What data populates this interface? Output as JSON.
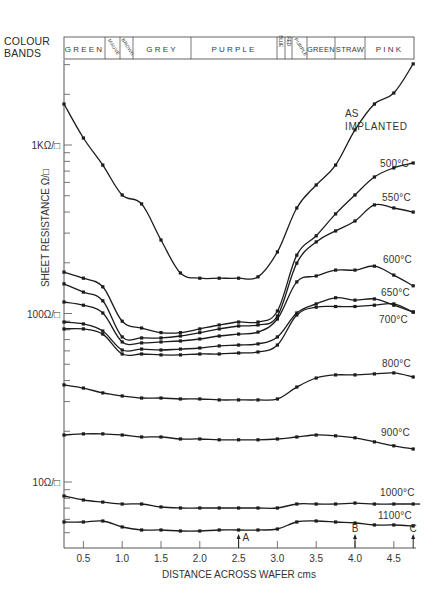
{
  "header": {
    "colour_bands_label_line1": "COLOUR",
    "colour_bands_label_line2": "BANDS"
  },
  "colour_bands": [
    {
      "label": "GREEN",
      "from_px": 64,
      "to_px": 105,
      "style": "h"
    },
    {
      "label": "MAUVE",
      "from_px": 105,
      "to_px": 120,
      "style": "diag"
    },
    {
      "label": "BROWN",
      "from_px": 120,
      "to_px": 133,
      "style": "diag"
    },
    {
      "label": "GREY",
      "from_px": 133,
      "to_px": 191,
      "style": "h"
    },
    {
      "label": "PURPLE",
      "from_px": 191,
      "to_px": 277,
      "style": "h"
    },
    {
      "label": "BLUE",
      "from_px": 277,
      "to_px": 285,
      "style": "v"
    },
    {
      "label": "RED",
      "from_px": 285,
      "to_px": 292,
      "style": "v"
    },
    {
      "label": "PURPLE",
      "from_px": 292,
      "to_px": 307,
      "style": "diag"
    },
    {
      "label": "GREEN",
      "from_px": 307,
      "to_px": 335,
      "style": "h"
    },
    {
      "label": "STRAW",
      "from_px": 335,
      "to_px": 365,
      "style": "h"
    },
    {
      "label": "PINK",
      "from_px": 365,
      "to_px": 414,
      "style": "h"
    }
  ],
  "chart_data": {
    "type": "line",
    "title": "",
    "xlabel": "DISTANCE ACROSS WAFER cms",
    "ylabel": "SHEET RESISTANCE Ω/□",
    "yscale": "log",
    "xlim": [
      0.25,
      4.78
    ],
    "ylim": [
      4.05,
      3190
    ],
    "grid": false,
    "x_ticks": [
      0.5,
      1.0,
      1.5,
      2.0,
      2.5,
      3.0,
      3.5,
      4.0,
      4.5
    ],
    "x_tick_labels": [
      "0.5",
      "1.0",
      "1.5",
      "2.0",
      "2.5",
      "3.0",
      "3.5",
      "4.0",
      "4.5"
    ],
    "y_ticks": [
      10,
      100,
      1000
    ],
    "y_tick_labels": [
      "10Ω/□",
      "100Ω/□",
      "1KΩ/□"
    ],
    "x": [
      0.25,
      0.5,
      0.75,
      1.0,
      1.25,
      1.5,
      1.75,
      2.0,
      2.25,
      2.5,
      2.75,
      3.0,
      3.25,
      3.5,
      3.75,
      4.0,
      4.25,
      4.5,
      4.75
    ],
    "series": [
      {
        "name": "AS IMPLANTED",
        "label_lines": [
          "AS",
          "IMPLANTED"
        ],
        "label_pos": [
          345,
          117
        ],
        "values": [
          1750,
          1100,
          760,
          505,
          447,
          273,
          174,
          162,
          162,
          162,
          165,
          232,
          423,
          579,
          760,
          1230,
          1750,
          2035,
          3030
        ]
      },
      {
        "name": "500°C",
        "label_lines": [
          "500°C"
        ],
        "label_pos": [
          380,
          167
        ],
        "values": [
          176,
          162,
          144,
          90,
          82,
          77,
          77,
          81,
          85.5,
          89,
          89,
          103.5,
          222,
          289,
          390,
          505,
          646,
          731,
          782
        ]
      },
      {
        "name": "550°C",
        "label_lines": [
          "550°C"
        ],
        "label_pos": [
          382,
          201
        ],
        "values": [
          150,
          134,
          119,
          72.6,
          71.6,
          71.6,
          73.5,
          77,
          81,
          84.3,
          85.5,
          96.6,
          199,
          266,
          309,
          354,
          441,
          423,
          400
        ]
      },
      {
        "name": "600°C",
        "label_lines": [
          "600°C"
        ],
        "label_pos": [
          383,
          263
        ],
        "values": [
          117,
          112,
          100.7,
          67.8,
          66.9,
          67.8,
          68.7,
          70.6,
          73.5,
          75.5,
          77.6,
          92.7,
          154,
          167,
          181,
          181,
          191,
          169,
          146
        ]
      },
      {
        "name": "650°C",
        "label_lines": [
          "650°C"
        ],
        "label_pos": [
          381,
          296
        ],
        "values": [
          89,
          86.7,
          78.7,
          60.7,
          61.5,
          60.7,
          61.5,
          62.4,
          64.2,
          65,
          66,
          72.6,
          100.7,
          114,
          124,
          120,
          122,
          112,
          102
        ]
      },
      {
        "name": "700°C",
        "label_lines": [
          "700°C"
        ],
        "label_pos": [
          379,
          323
        ],
        "values": [
          81,
          81,
          75.5,
          57.5,
          57.5,
          56.8,
          56.8,
          57.5,
          57.5,
          58.3,
          59.1,
          65,
          98,
          109,
          110,
          110,
          112,
          114,
          102
        ]
      },
      {
        "name": "800°C",
        "label_lines": [
          "800°C"
        ],
        "label_pos": [
          382,
          367
        ],
        "values": [
          37.7,
          36.1,
          33.8,
          32.4,
          31.5,
          31.5,
          31.1,
          31.1,
          30.7,
          30.7,
          30.7,
          31.1,
          36.6,
          41.4,
          43.2,
          43.2,
          43.8,
          44.4,
          42
        ]
      },
      {
        "name": "900°C",
        "label_lines": [
          "900°C"
        ],
        "label_pos": [
          381,
          436
        ],
        "values": [
          19,
          19.3,
          19.3,
          19,
          18.5,
          18.5,
          18,
          18,
          17.8,
          17.8,
          17.8,
          18,
          18.5,
          19,
          18.8,
          18.3,
          17.3,
          16.4,
          15.7
        ]
      },
      {
        "name": "1000°C",
        "label_lines": [
          "1000°C"
        ],
        "label_pos": [
          380,
          496
        ],
        "values": [
          8.26,
          7.82,
          7.6,
          7.4,
          7.4,
          7.11,
          7.01,
          7.01,
          7.01,
          7.01,
          7.01,
          7.01,
          7.4,
          7.4,
          7.4,
          7.5,
          7.4,
          7.4,
          7.4
        ]
      },
      {
        "name": "1100°C",
        "label_lines": [
          "1100°C"
        ],
        "label_pos": [
          378,
          519
        ],
        "values": [
          5.79,
          5.79,
          5.87,
          5.41,
          5.19,
          5.19,
          5.12,
          5.12,
          5.19,
          5.19,
          5.19,
          5.26,
          5.79,
          5.87,
          5.79,
          5.71,
          5.56,
          5.56,
          5.48
        ]
      }
    ],
    "annotations": [
      {
        "label": "A",
        "x": 2.5
      },
      {
        "label": "B",
        "x": 4.0
      },
      {
        "label": "C",
        "x": 4.75
      }
    ]
  }
}
